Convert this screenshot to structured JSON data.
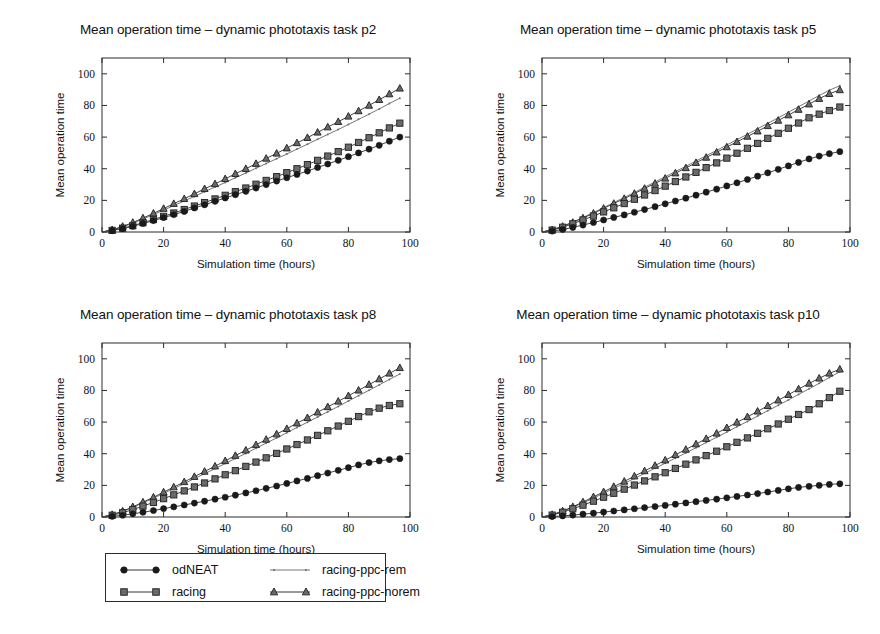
{
  "figure": {
    "width": 880,
    "height": 634,
    "background": "#ffffff"
  },
  "legend": {
    "entries": [
      {
        "label": "odNEAT",
        "marker": "circle",
        "color": "#1a1a1a"
      },
      {
        "label": "racing-ppc-rem",
        "marker": "dot",
        "color": "#6e6e6e"
      },
      {
        "label": "racing",
        "marker": "square",
        "color": "#4d4d4d"
      },
      {
        "label": "racing-ppc-norem",
        "marker": "triangle",
        "color": "#3a3a3a"
      }
    ],
    "order": [
      "odNEAT",
      "racing-ppc-rem",
      "racing",
      "racing-ppc-norem"
    ]
  },
  "chart_data": [
    {
      "type": "line",
      "id": "p2",
      "title": "Mean operation time – dynamic phototaxis task p2",
      "xlabel": "Simulation time (hours)",
      "ylabel": "Mean operation time",
      "xlim": [
        0,
        100
      ],
      "ylim": [
        0,
        110
      ],
      "xticks": [
        0,
        20,
        40,
        60,
        80,
        100
      ],
      "yticks": [
        0,
        20,
        40,
        60,
        80,
        100
      ],
      "grid": false,
      "legend_position": "figure-bottom",
      "x": [
        0,
        3.3,
        6.7,
        10,
        13.3,
        16.7,
        20,
        23.3,
        26.7,
        30,
        33.3,
        36.7,
        40,
        43.3,
        46.7,
        50,
        53.3,
        56.7,
        60,
        63.3,
        66.7,
        70,
        73.3,
        76.7,
        80,
        83.3,
        86.7,
        90,
        93.3,
        96.7
      ],
      "series": [
        {
          "name": "odNEAT",
          "marker": "circle",
          "color": "#1a1a1a",
          "values": [
            0,
            0.9,
            2.1,
            3.6,
            5.4,
            7.2,
            9.1,
            11.0,
            13.0,
            15.2,
            17.2,
            19.4,
            21.5,
            23.6,
            25.7,
            27.8,
            30.0,
            32.2,
            34.3,
            36.4,
            38.5,
            40.8,
            43.0,
            45.3,
            47.6,
            50.0,
            52.4,
            54.8,
            57.4,
            60.0
          ]
        },
        {
          "name": "racing",
          "marker": "square",
          "color": "#4d4d4d",
          "values": [
            0,
            1.0,
            2.4,
            4.0,
            5.9,
            7.9,
            9.9,
            12.0,
            14.2,
            16.4,
            18.6,
            20.9,
            23.2,
            25.5,
            27.8,
            30.2,
            32.6,
            35.0,
            37.5,
            40.0,
            42.6,
            45.3,
            48.0,
            50.8,
            53.6,
            56.6,
            59.6,
            62.7,
            65.8,
            68.8
          ]
        },
        {
          "name": "racing-ppc-rem",
          "marker": "dot",
          "color": "#6e6e6e",
          "values": [
            0,
            1.3,
            3.2,
            5.6,
            8.2,
            11.0,
            13.8,
            16.7,
            19.6,
            22.5,
            25.5,
            28.4,
            31.3,
            34.3,
            37.3,
            40.3,
            43.3,
            46.3,
            49.3,
            52.4,
            55.5,
            58.6,
            61.7,
            64.8,
            68.0,
            71.2,
            74.5,
            77.8,
            81.2,
            84.6
          ]
        },
        {
          "name": "racing-ppc-norem",
          "marker": "triangle",
          "color": "#3a3a3a",
          "values": [
            0,
            1.4,
            3.5,
            6.0,
            8.8,
            11.8,
            14.8,
            17.9,
            21.0,
            24.1,
            27.3,
            30.4,
            33.6,
            36.8,
            40.0,
            43.2,
            46.5,
            49.7,
            53.0,
            56.3,
            59.6,
            63.0,
            66.3,
            69.7,
            73.1,
            76.5,
            80.0,
            83.6,
            87.2,
            90.8
          ]
        }
      ]
    },
    {
      "type": "line",
      "id": "p5",
      "title": "Mean operation time – dynamic phototaxis task p5",
      "xlabel": "Simulation time (hours)",
      "ylabel": "Mean operation time",
      "xlim": [
        0,
        100
      ],
      "ylim": [
        0,
        110
      ],
      "xticks": [
        0,
        20,
        40,
        60,
        80,
        100
      ],
      "yticks": [
        0,
        20,
        40,
        60,
        80,
        100
      ],
      "grid": false,
      "legend_position": "figure-bottom",
      "x": [
        0,
        3.3,
        6.7,
        10,
        13.3,
        16.7,
        20,
        23.3,
        26.7,
        30,
        33.3,
        36.7,
        40,
        43.3,
        46.7,
        50,
        53.3,
        56.7,
        60,
        63.3,
        66.7,
        70,
        73.3,
        76.7,
        80,
        83.3,
        86.7,
        90,
        93.3,
        96.7
      ],
      "series": [
        {
          "name": "odNEAT",
          "marker": "circle",
          "color": "#1a1a1a",
          "values": [
            0,
            0.6,
            1.6,
            2.9,
            4.4,
            6.0,
            7.6,
            9.2,
            10.8,
            12.5,
            14.2,
            16.0,
            17.8,
            19.6,
            21.4,
            23.3,
            25.2,
            27.1,
            29.1,
            31.1,
            33.2,
            35.3,
            37.4,
            39.6,
            41.8,
            44.0,
            46.2,
            48.0,
            49.5,
            50.8
          ]
        },
        {
          "name": "racing",
          "marker": "square",
          "color": "#4d4d4d",
          "values": [
            0,
            1.2,
            3.0,
            5.2,
            7.6,
            10.1,
            12.7,
            15.3,
            18.0,
            20.7,
            23.4,
            26.2,
            29.0,
            31.9,
            34.8,
            37.7,
            40.7,
            43.7,
            46.7,
            49.8,
            52.9,
            56.0,
            59.2,
            62.4,
            65.6,
            68.9,
            72.2,
            74.5,
            76.8,
            79.0
          ]
        },
        {
          "name": "racing-ppc-rem",
          "marker": "dot",
          "color": "#6e6e6e",
          "values": [
            0,
            1.5,
            3.7,
            6.3,
            9.2,
            12.3,
            15.4,
            18.6,
            21.8,
            25.0,
            28.3,
            31.6,
            34.9,
            38.2,
            41.5,
            44.9,
            48.2,
            51.6,
            55.0,
            58.4,
            61.8,
            65.3,
            68.7,
            72.2,
            75.7,
            79.2,
            82.8,
            86.3,
            89.6,
            92.5
          ]
        },
        {
          "name": "racing-ppc-norem",
          "marker": "triangle",
          "color": "#3a3a3a",
          "values": [
            0,
            1.4,
            3.5,
            6.0,
            8.8,
            11.8,
            14.9,
            18.0,
            21.1,
            24.3,
            27.5,
            30.7,
            33.9,
            37.2,
            40.5,
            43.8,
            47.1,
            50.4,
            53.7,
            57.0,
            60.4,
            63.7,
            67.1,
            70.5,
            73.9,
            77.4,
            80.8,
            84.3,
            87.4,
            89.8
          ]
        }
      ]
    },
    {
      "type": "line",
      "id": "p8",
      "title": "Mean operation time – dynamic phototaxis task p8",
      "xlabel": "Simulation time (hours)",
      "ylabel": "Mean operation time",
      "xlim": [
        0,
        100
      ],
      "ylim": [
        0,
        110
      ],
      "xticks": [
        0,
        20,
        40,
        60,
        80,
        100
      ],
      "yticks": [
        0,
        20,
        40,
        60,
        80,
        100
      ],
      "grid": false,
      "legend_position": "figure-bottom",
      "x": [
        0,
        3.3,
        6.7,
        10,
        13.3,
        16.7,
        20,
        23.3,
        26.7,
        30,
        33.3,
        36.7,
        40,
        43.3,
        46.7,
        50,
        53.3,
        56.7,
        60,
        63.3,
        66.7,
        70,
        73.3,
        76.7,
        80,
        83.3,
        86.7,
        90,
        93.3,
        96.7
      ],
      "series": [
        {
          "name": "odNEAT",
          "marker": "circle",
          "color": "#1a1a1a",
          "values": [
            0,
            0.4,
            1.1,
            2.0,
            3.0,
            4.1,
            5.3,
            6.4,
            7.6,
            8.8,
            10.0,
            11.3,
            12.5,
            13.8,
            15.2,
            16.6,
            18.1,
            19.6,
            21.2,
            22.8,
            24.4,
            26.1,
            27.8,
            29.5,
            31.2,
            32.9,
            34.4,
            35.5,
            36.3,
            36.9
          ]
        },
        {
          "name": "racing",
          "marker": "square",
          "color": "#4d4d4d",
          "values": [
            0,
            1.1,
            2.7,
            4.7,
            6.9,
            9.2,
            11.6,
            14.0,
            16.5,
            19.0,
            21.5,
            24.1,
            26.7,
            29.3,
            32.0,
            34.7,
            37.4,
            40.2,
            43.0,
            45.8,
            48.7,
            51.6,
            54.5,
            57.5,
            60.5,
            63.5,
            66.5,
            68.8,
            70.5,
            71.6
          ]
        },
        {
          "name": "racing-ppc-rem",
          "marker": "dot",
          "color": "#6e6e6e",
          "values": [
            0,
            1.4,
            3.5,
            6.1,
            8.9,
            11.9,
            14.9,
            18.0,
            21.1,
            24.3,
            27.4,
            30.6,
            33.8,
            37.0,
            40.2,
            43.5,
            46.7,
            50.0,
            53.3,
            56.6,
            59.9,
            63.2,
            66.5,
            69.9,
            73.3,
            76.7,
            80.1,
            83.5,
            87.0,
            90.4
          ]
        },
        {
          "name": "racing-ppc-norem",
          "marker": "triangle",
          "color": "#3a3a3a",
          "values": [
            0,
            1.5,
            3.7,
            6.4,
            9.4,
            12.5,
            15.7,
            18.9,
            22.2,
            25.5,
            28.8,
            32.1,
            35.5,
            38.8,
            42.2,
            45.6,
            49.0,
            52.4,
            55.8,
            59.3,
            62.7,
            66.2,
            69.6,
            73.1,
            76.6,
            80.1,
            83.7,
            87.2,
            90.8,
            94.3
          ]
        }
      ]
    },
    {
      "type": "line",
      "id": "p10",
      "title": "Mean operation time – dynamic phototaxis task p10",
      "xlabel": "Simulation time (hours)",
      "ylabel": "Mean operation time",
      "xlim": [
        0,
        100
      ],
      "ylim": [
        0,
        110
      ],
      "xticks": [
        0,
        20,
        40,
        60,
        80,
        100
      ],
      "yticks": [
        0,
        20,
        40,
        60,
        80,
        100
      ],
      "grid": false,
      "legend_position": "figure-bottom",
      "x": [
        0,
        3.3,
        6.7,
        10,
        13.3,
        16.7,
        20,
        23.3,
        26.7,
        30,
        33.3,
        36.7,
        40,
        43.3,
        46.7,
        50,
        53.3,
        56.7,
        60,
        63.3,
        66.7,
        70,
        73.3,
        76.7,
        80,
        83.3,
        86.7,
        90,
        93.3,
        96.7
      ],
      "series": [
        {
          "name": "odNEAT",
          "marker": "circle",
          "color": "#1a1a1a",
          "values": [
            0,
            0.3,
            0.7,
            1.2,
            1.8,
            2.4,
            3.1,
            3.8,
            4.5,
            5.2,
            5.9,
            6.6,
            7.3,
            8.1,
            8.9,
            9.7,
            10.5,
            11.3,
            12.1,
            13.0,
            13.9,
            14.8,
            15.8,
            16.8,
            17.8,
            18.7,
            19.4,
            20.0,
            20.6,
            21.0
          ]
        },
        {
          "name": "racing",
          "marker": "square",
          "color": "#4d4d4d",
          "values": [
            0,
            1.2,
            3.0,
            5.2,
            7.5,
            10.0,
            12.5,
            15.0,
            17.6,
            20.2,
            22.8,
            25.4,
            28.0,
            30.7,
            33.4,
            36.1,
            38.8,
            41.6,
            44.4,
            47.2,
            50.0,
            52.9,
            55.8,
            58.8,
            61.8,
            64.8,
            67.9,
            71.6,
            75.5,
            79.5
          ]
        },
        {
          "name": "racing-ppc-rem",
          "marker": "dot",
          "color": "#6e6e6e",
          "values": [
            0,
            1.4,
            3.5,
            6.1,
            8.9,
            11.9,
            15.0,
            18.1,
            21.2,
            24.4,
            27.6,
            30.8,
            34.0,
            37.2,
            40.5,
            43.8,
            47.1,
            50.4,
            53.7,
            57.1,
            60.4,
            63.8,
            67.2,
            70.6,
            74.0,
            77.5,
            81.0,
            84.5,
            88.2,
            91.8
          ]
        },
        {
          "name": "racing-ppc-norem",
          "marker": "triangle",
          "color": "#3a3a3a",
          "values": [
            0,
            1.5,
            3.8,
            6.5,
            9.5,
            12.7,
            15.9,
            19.2,
            22.5,
            25.8,
            29.1,
            32.5,
            35.9,
            39.3,
            42.7,
            46.1,
            49.5,
            52.9,
            56.4,
            59.8,
            63.3,
            66.8,
            70.3,
            73.8,
            77.3,
            80.9,
            84.4,
            87.7,
            90.8,
            93.4
          ]
        }
      ]
    }
  ]
}
